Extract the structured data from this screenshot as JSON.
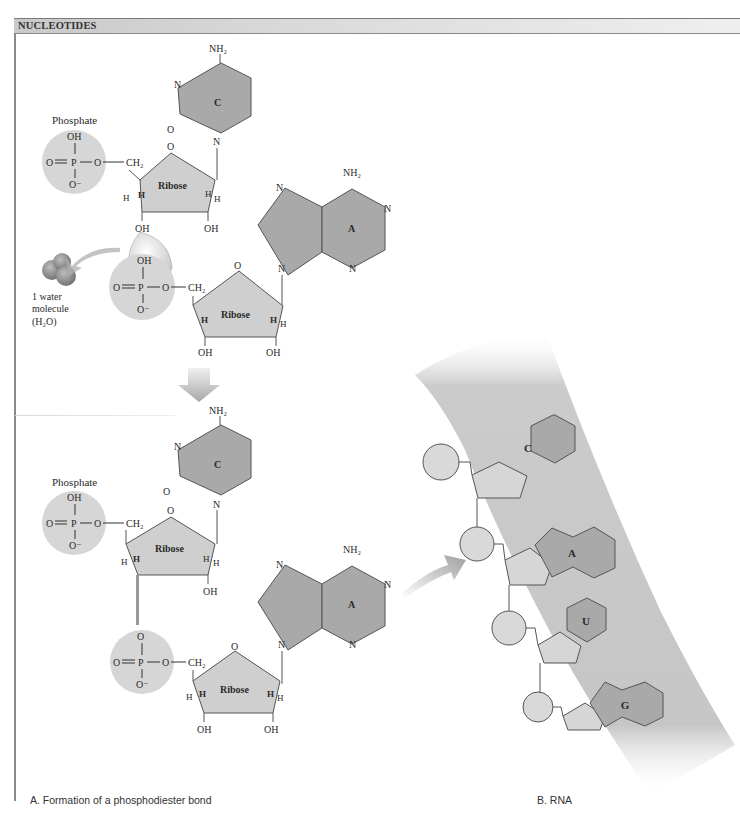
{
  "header": {
    "title": "NUCLEOTIDES"
  },
  "panel_a": {
    "caption": "A. Formation of a phosphodiester bond",
    "top": {
      "phosphate_label": "Phosphate",
      "phosphate1": {
        "oh": "OH",
        "o_left": "O",
        "p": "P",
        "o_right": "O",
        "o_minus": "O⁻"
      },
      "phosphate2": {
        "oh": "OH",
        "o_left": "O",
        "p": "P",
        "o_right": "O",
        "o_minus": "O⁻"
      },
      "ch2": "CH₂",
      "ribose_label": "Ribose",
      "ring_o": "O",
      "h": "H",
      "oh": "OH",
      "cytosine": {
        "letter": "C",
        "nh2": "NH₂",
        "n": "N",
        "o": "O"
      },
      "adenine": {
        "letter": "A",
        "nh2": "NH₂",
        "n": "N"
      },
      "water": {
        "line1": "1 water",
        "line2": "molecule",
        "line3": "(H₂O)"
      }
    },
    "bottom": {
      "phosphate_label": "Phosphate",
      "bridge_o": "O"
    }
  },
  "panel_b": {
    "caption": "B. RNA",
    "bases": [
      "C",
      "A",
      "U",
      "G"
    ]
  },
  "colors": {
    "base_fill": "#a9a9a9",
    "sugar_fill": "#cfcfcf",
    "phosphate_fill": "#d6d6d6",
    "backbone_band": "#c8c8c8",
    "stroke": "#555555"
  }
}
